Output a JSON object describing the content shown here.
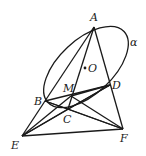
{
  "diagram": {
    "type": "geometry-figure",
    "plane_label": "α",
    "points": {
      "A": {
        "label": "A",
        "x": 94,
        "y": 27
      },
      "O": {
        "label": "O",
        "x": 85,
        "y": 68
      },
      "B": {
        "label": "B",
        "x": 45,
        "y": 101
      },
      "M": {
        "label": "M",
        "x": 71,
        "y": 96
      },
      "D": {
        "label": "D",
        "x": 110,
        "y": 85
      },
      "C": {
        "label": "C",
        "x": 68,
        "y": 109
      },
      "E": {
        "label": "E",
        "x": 22,
        "y": 136
      },
      "F": {
        "label": "F",
        "x": 123,
        "y": 129
      }
    },
    "segments": [
      [
        "A",
        "B"
      ],
      [
        "A",
        "C"
      ],
      [
        "A",
        "F"
      ],
      [
        "B",
        "D"
      ],
      [
        "B",
        "E"
      ],
      [
        "B",
        "F"
      ],
      [
        "M",
        "D"
      ],
      [
        "M",
        "E"
      ],
      [
        "M",
        "F"
      ],
      [
        "C",
        "D"
      ],
      [
        "C",
        "E"
      ],
      [
        "C",
        "F"
      ],
      [
        "D",
        "E"
      ],
      [
        "E",
        "F"
      ],
      [
        "B",
        "C"
      ]
    ],
    "ellipse": {
      "cx": 86,
      "cy": 67,
      "rx": 52,
      "ry": 27,
      "rotation": -43
    }
  }
}
